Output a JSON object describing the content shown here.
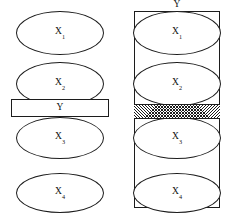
{
  "figure": {
    "width": 232,
    "height": 216,
    "background": "#ffffff",
    "stroke_color": "#1c1c1c",
    "text_color": "#111111"
  },
  "left_panel": {
    "name": "unconstrained-chain",
    "nodes": [
      {
        "base": "X",
        "subscript": "1",
        "cx": 60,
        "cy": 33,
        "rx": 44,
        "ry": 22
      },
      {
        "base": "X",
        "subscript": "2",
        "cx": 60,
        "cy": 84,
        "rx": 44,
        "ry": 22
      },
      {
        "base": "X",
        "subscript": "3",
        "cx": 60,
        "cy": 138,
        "rx": 44,
        "ry": 21
      },
      {
        "base": "X",
        "subscript": "4",
        "cx": 60,
        "cy": 193,
        "rx": 44,
        "ry": 20
      }
    ],
    "y_bar": {
      "label": "Y",
      "x": 11,
      "y": 99,
      "width": 98,
      "height": 18,
      "fill": "#ffffff"
    }
  },
  "right_panel": {
    "name": "constrained-chain",
    "caption": "Y",
    "frame": {
      "x": 14,
      "y": 11,
      "width": 86,
      "height": 197
    },
    "nodes": [
      {
        "base": "X",
        "subscript": "1",
        "cx": 57,
        "cy": 33,
        "rx": 44,
        "ry": 22
      },
      {
        "base": "X",
        "subscript": "2",
        "cx": 57,
        "cy": 84,
        "rx": 44,
        "ry": 22
      },
      {
        "base": "X",
        "subscript": "3",
        "cx": 57,
        "cy": 138,
        "rx": 44,
        "ry": 21
      },
      {
        "base": "X",
        "subscript": "4",
        "cx": 57,
        "cy": 193,
        "rx": 44,
        "ry": 20
      }
    ],
    "y_band": {
      "x": 14,
      "y": 104,
      "width": 86,
      "height": 15,
      "fill_style": "cross-hatch"
    }
  }
}
